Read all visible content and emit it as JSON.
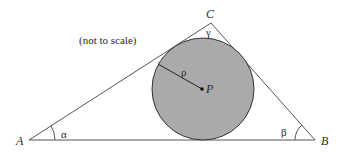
{
  "diagram": {
    "note": "(not to scale)",
    "vertices": {
      "A": {
        "label": "A",
        "x": 29,
        "y": 140
      },
      "B": {
        "label": "B",
        "x": 315,
        "y": 140
      },
      "C": {
        "label": "C",
        "x": 211,
        "y": 23
      }
    },
    "angles": {
      "alpha": "α",
      "beta": "β",
      "gamma": "γ"
    },
    "incircle": {
      "center_label": "P",
      "radius_label": "ρ",
      "cx": 203,
      "cy": 89,
      "r": 51,
      "fill": "#aaaaaa",
      "stroke": "#333333"
    },
    "colors": {
      "line": "#555555",
      "text": "#2a2a2a",
      "background": "#ffffff"
    }
  }
}
